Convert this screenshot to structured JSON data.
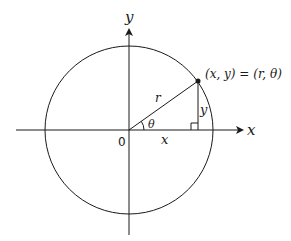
{
  "diagram": {
    "labels": {
      "x_axis": "x",
      "y_axis": "y",
      "origin": "0",
      "radius": "r",
      "angle": "θ",
      "x_leg": "x",
      "y_leg": "y",
      "point": "(x, y) = (r, θ)"
    },
    "colors": {
      "stroke": "#1a1a1a",
      "background": "#ffffff"
    }
  }
}
